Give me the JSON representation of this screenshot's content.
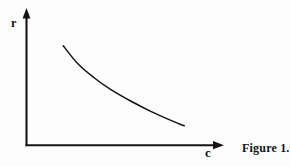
{
  "figure": {
    "caption": "Figure 1.6",
    "y_axis_label": "r",
    "x_axis_label": "c",
    "ink_color": "#141414",
    "background_color": "#fdfdfd"
  },
  "chart_data": {
    "type": "line",
    "title": "Figure 1.6",
    "xlabel": "c",
    "ylabel": "r",
    "grid": false,
    "legend": null,
    "axis_style": "arrow-headed schematic axes, no tick marks, no numeric scale",
    "xlim": [
      0,
      1
    ],
    "ylim": [
      0,
      1
    ],
    "series": [
      {
        "name": "r(c)",
        "description": "smooth convex monotonically decreasing curve",
        "x": [
          0.2,
          0.28,
          0.37,
          0.46,
          0.57,
          0.68,
          0.79,
          0.86
        ],
        "y": [
          0.77,
          0.63,
          0.52,
          0.43,
          0.34,
          0.26,
          0.19,
          0.15
        ]
      }
    ]
  }
}
